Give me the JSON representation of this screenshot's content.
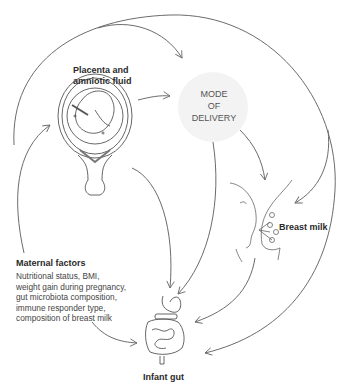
{
  "diagram": {
    "nodes": {
      "placenta": {
        "title_line1": "Placenta and",
        "title_line2": "amniotic fluid",
        "icon": "uterus-with-fetus-icon"
      },
      "mode_of_delivery": {
        "line1": "MODE",
        "line2": "OF",
        "line3": "DELIVERY"
      },
      "breast_milk": {
        "title": "Breast milk",
        "icon": "breastfeeding-infant-icon"
      },
      "maternal_factors": {
        "title": "Maternal factors",
        "lines": [
          "Nutritional status, BMI,",
          "weight gain during pregnancy,",
          "gut microbiota composition,",
          "immune responder type,",
          "composition of breast milk"
        ]
      },
      "infant_gut": {
        "title": "Infant gut",
        "icon": "digestive-tract-icon"
      }
    },
    "edges": [
      {
        "from": "maternal_factors",
        "to": "placenta"
      },
      {
        "from": "maternal_factors",
        "to": "mode_of_delivery"
      },
      {
        "from": "maternal_factors",
        "to": "breast_milk"
      },
      {
        "from": "maternal_factors",
        "to": "infant_gut"
      },
      {
        "from": "placenta",
        "to": "mode_of_delivery"
      },
      {
        "from": "placenta",
        "to": "infant_gut"
      },
      {
        "from": "mode_of_delivery",
        "to": "infant_gut"
      },
      {
        "from": "mode_of_delivery",
        "to": "breast_milk"
      },
      {
        "from": "breast_milk",
        "to": "infant_gut"
      },
      {
        "from": "outer_loop",
        "to": "infant_gut"
      }
    ],
    "colors": {
      "line": "#6b6b6b",
      "mode_circle": "#f2f2f2",
      "text": "#2a2a2a"
    }
  }
}
